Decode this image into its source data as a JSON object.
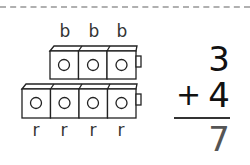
{
  "top_labels": [
    "b",
    "b",
    "b"
  ],
  "bottom_labels": [
    "r",
    "r",
    "r",
    "r"
  ],
  "problem": {
    "addend1": "3",
    "operator": "+",
    "addend2": "4",
    "sum": "7"
  }
}
